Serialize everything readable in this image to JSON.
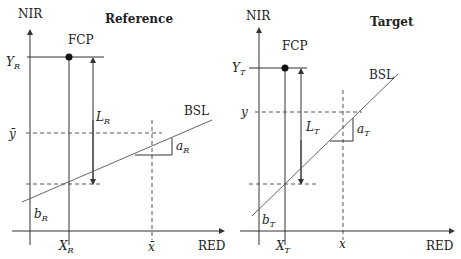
{
  "panels": {
    "reference": {
      "title": "Reference",
      "y_axis_label": "NIR",
      "x_axis_label": "RED",
      "point_label": "FCP",
      "line_label": "BSL",
      "y_fcp_main": "Y",
      "y_fcp_sub": "R",
      "x_fcp_main": "X",
      "x_fcp_sub": "R",
      "length_main": "L",
      "length_sub": "R",
      "slope_main": "a",
      "slope_sub": "R",
      "intercept_main": "b",
      "intercept_sub": "R",
      "y_mean_label": "ȳ",
      "x_mean_label": "x̄"
    },
    "target": {
      "title": "Target",
      "y_axis_label": "NIR",
      "x_axis_label": "RED",
      "point_label": "FCP",
      "line_label": "BSL",
      "y_fcp_main": "Y",
      "y_fcp_sub": "T",
      "x_fcp_main": "X",
      "x_fcp_sub": "T",
      "length_main": "L",
      "length_sub": "T",
      "slope_main": "a",
      "slope_sub": "T",
      "intercept_main": "b",
      "intercept_sub": "T",
      "y_label": "y",
      "x_label": "x"
    }
  }
}
